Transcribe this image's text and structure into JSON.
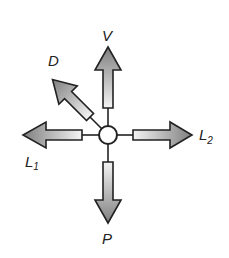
{
  "diagram": {
    "type": "force-diagram",
    "center": {
      "shape": "circle",
      "x": 108,
      "y": 135,
      "r": 9
    },
    "colors": {
      "arrow_fill_dark": "#8a8a8a",
      "arrow_fill_light": "#f2f2f2",
      "stroke": "#222222",
      "background": "#ffffff"
    },
    "arrows": [
      {
        "id": "V",
        "label": "V",
        "subscript": "",
        "direction": "up"
      },
      {
        "id": "D",
        "label": "D",
        "subscript": "",
        "direction": "up-left"
      },
      {
        "id": "L1",
        "label": "L",
        "subscript": "1",
        "direction": "left"
      },
      {
        "id": "L2",
        "label": "L",
        "subscript": "2",
        "direction": "right"
      },
      {
        "id": "P",
        "label": "P",
        "subscript": "",
        "direction": "down"
      }
    ]
  }
}
